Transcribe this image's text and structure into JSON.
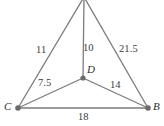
{
  "figure": {
    "type": "geometry-diagram",
    "background_color": "#ffffff",
    "line_color": "#7b7b7b",
    "vertex_dot_color": "#6a6a6a",
    "text_color": "#3b3b3b"
  },
  "vertices": [
    {
      "id": "apex",
      "label": "",
      "x": 84,
      "y": -3,
      "dot": false
    },
    {
      "id": "D",
      "label": "D",
      "x": 83,
      "y": 78,
      "dot": true,
      "label_x": 87,
      "label_y": 65
    },
    {
      "id": "C",
      "label": "C",
      "x": 18,
      "y": 108,
      "dot": true,
      "label_x": 4,
      "label_y": 102
    },
    {
      "id": "B",
      "label": "B",
      "x": 148,
      "y": 108,
      "dot": true,
      "label_x": 153,
      "label_y": 102
    }
  ],
  "edges": [
    {
      "id": "apex-C",
      "from": "apex",
      "to": "C",
      "label": "11",
      "label_x": 36,
      "label_y": 45
    },
    {
      "id": "apex-D",
      "from": "apex",
      "to": "D",
      "label": "10",
      "label_x": 83,
      "label_y": 43
    },
    {
      "id": "apex-B",
      "from": "apex",
      "to": "B",
      "label": "21.5",
      "label_x": 119,
      "label_y": 44
    },
    {
      "id": "D-C",
      "from": "D",
      "to": "C",
      "label": "7.5",
      "label_x": 38,
      "label_y": 78
    },
    {
      "id": "D-B",
      "from": "D",
      "to": "B",
      "label": "14",
      "label_x": 110,
      "label_y": 80
    },
    {
      "id": "C-B",
      "from": "C",
      "to": "B",
      "label": "18",
      "label_x": 78,
      "label_y": 112
    }
  ],
  "labels": {
    "edge_11": "11",
    "edge_10": "10",
    "edge_21_5": "21.5",
    "edge_7_5": "7.5",
    "edge_14": "14",
    "edge_18": "18",
    "vertex_D": "D",
    "vertex_C": "C",
    "vertex_B": "B"
  }
}
